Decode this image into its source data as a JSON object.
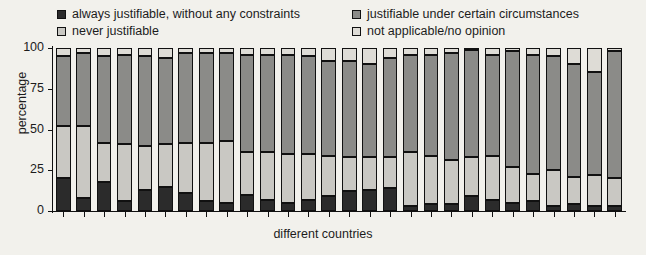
{
  "legend": {
    "items": [
      {
        "label": "always justifiable, without any constraints",
        "color": "#2b2b2b"
      },
      {
        "label": "never justifiable",
        "color": "#c9c8c3"
      },
      {
        "label": "justifiable under certain circumstances",
        "color": "#8b8b88"
      },
      {
        "label": "not applicable/no opinion",
        "color": "#dedcd6"
      }
    ]
  },
  "axes": {
    "ylabel": "percentage",
    "xlabel": "different countries",
    "yticks": [
      0,
      25,
      50,
      75,
      100
    ],
    "ytick_labels": [
      "0",
      "25",
      "50",
      "75",
      "100"
    ],
    "ylim": [
      0,
      100
    ],
    "grid": false
  },
  "chart_data": {
    "type": "bar",
    "stacked": true,
    "title": "",
    "xlabel": "different countries",
    "ylabel": "percentage",
    "ylim": [
      0,
      100
    ],
    "grid": false,
    "legend_position": "top",
    "categories": [
      "1",
      "2",
      "3",
      "4",
      "5",
      "6",
      "7",
      "8",
      "9",
      "10",
      "11",
      "12",
      "13",
      "14",
      "15",
      "16",
      "17",
      "18",
      "19",
      "20",
      "21",
      "22",
      "23",
      "24",
      "25",
      "26",
      "27",
      "28"
    ],
    "series": [
      {
        "name": "always justifiable, without any constraints",
        "color": "#2b2b2b",
        "values": [
          20,
          8,
          18,
          6,
          13,
          15,
          11,
          6,
          5,
          10,
          7,
          5,
          7,
          9,
          12,
          13,
          14,
          3,
          4,
          4,
          9,
          7,
          5,
          6,
          3,
          4,
          3,
          3
        ]
      },
      {
        "name": "never justifiable",
        "color": "#c9c8c3",
        "values": [
          32,
          44,
          24,
          35,
          27,
          26,
          31,
          36,
          38,
          26,
          29,
          30,
          28,
          25,
          21,
          20,
          19,
          33,
          30,
          27,
          24,
          27,
          22,
          17,
          22,
          17,
          19,
          17
        ]
      },
      {
        "name": "justifiable under certain circumstances",
        "color": "#8b8b88",
        "values": [
          43,
          45,
          53,
          55,
          55,
          53,
          55,
          55,
          54,
          60,
          60,
          61,
          60,
          58,
          59,
          57,
          61,
          60,
          62,
          66,
          66,
          62,
          71,
          73,
          70,
          69,
          63,
          78
        ]
      },
      {
        "name": "not applicable/no opinion",
        "color": "#dedcd6",
        "values": [
          5,
          3,
          5,
          4,
          5,
          6,
          3,
          3,
          3,
          4,
          4,
          4,
          5,
          8,
          8,
          10,
          6,
          4,
          4,
          3,
          1,
          4,
          2,
          4,
          5,
          10,
          15,
          2
        ]
      }
    ]
  }
}
